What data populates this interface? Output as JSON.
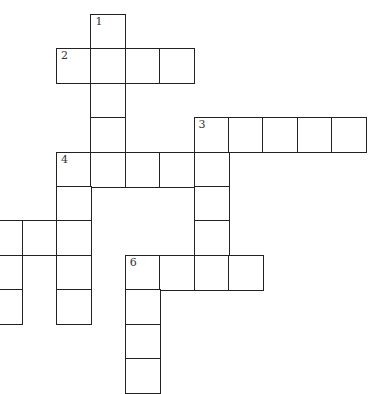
{
  "puzzle": {
    "type": "crossword",
    "cell_size": 34.4,
    "origin": {
      "x": 56,
      "y": 14
    },
    "border_color": "#222222",
    "cells": [
      {
        "r": 0,
        "c": 1,
        "num": "1"
      },
      {
        "r": 1,
        "c": 0,
        "num": "2"
      },
      {
        "r": 1,
        "c": 1
      },
      {
        "r": 1,
        "c": 2
      },
      {
        "r": 1,
        "c": 3
      },
      {
        "r": 2,
        "c": 1
      },
      {
        "r": 3,
        "c": 1
      },
      {
        "r": 3,
        "c": 4,
        "num": "3"
      },
      {
        "r": 3,
        "c": 5
      },
      {
        "r": 3,
        "c": 6
      },
      {
        "r": 3,
        "c": 7
      },
      {
        "r": 3,
        "c": 8
      },
      {
        "r": 4,
        "c": 0,
        "num": "4"
      },
      {
        "r": 4,
        "c": 1
      },
      {
        "r": 4,
        "c": 2
      },
      {
        "r": 4,
        "c": 3
      },
      {
        "r": 4,
        "c": 4
      },
      {
        "r": 5,
        "c": 0
      },
      {
        "r": 5,
        "c": 4
      },
      {
        "r": 6,
        "c": -2
      },
      {
        "r": 6,
        "c": -1
      },
      {
        "r": 6,
        "c": 0
      },
      {
        "r": 6,
        "c": 4
      },
      {
        "r": 7,
        "c": -2
      },
      {
        "r": 7,
        "c": 0
      },
      {
        "r": 7,
        "c": 2,
        "num": "6"
      },
      {
        "r": 7,
        "c": 3
      },
      {
        "r": 7,
        "c": 4
      },
      {
        "r": 7,
        "c": 5
      },
      {
        "r": 8,
        "c": -2
      },
      {
        "r": 8,
        "c": 0
      },
      {
        "r": 8,
        "c": 2
      },
      {
        "r": 9,
        "c": 2
      },
      {
        "r": 10,
        "c": 2
      }
    ],
    "clue_numbers": [
      "1",
      "2",
      "3",
      "4",
      "6"
    ]
  }
}
